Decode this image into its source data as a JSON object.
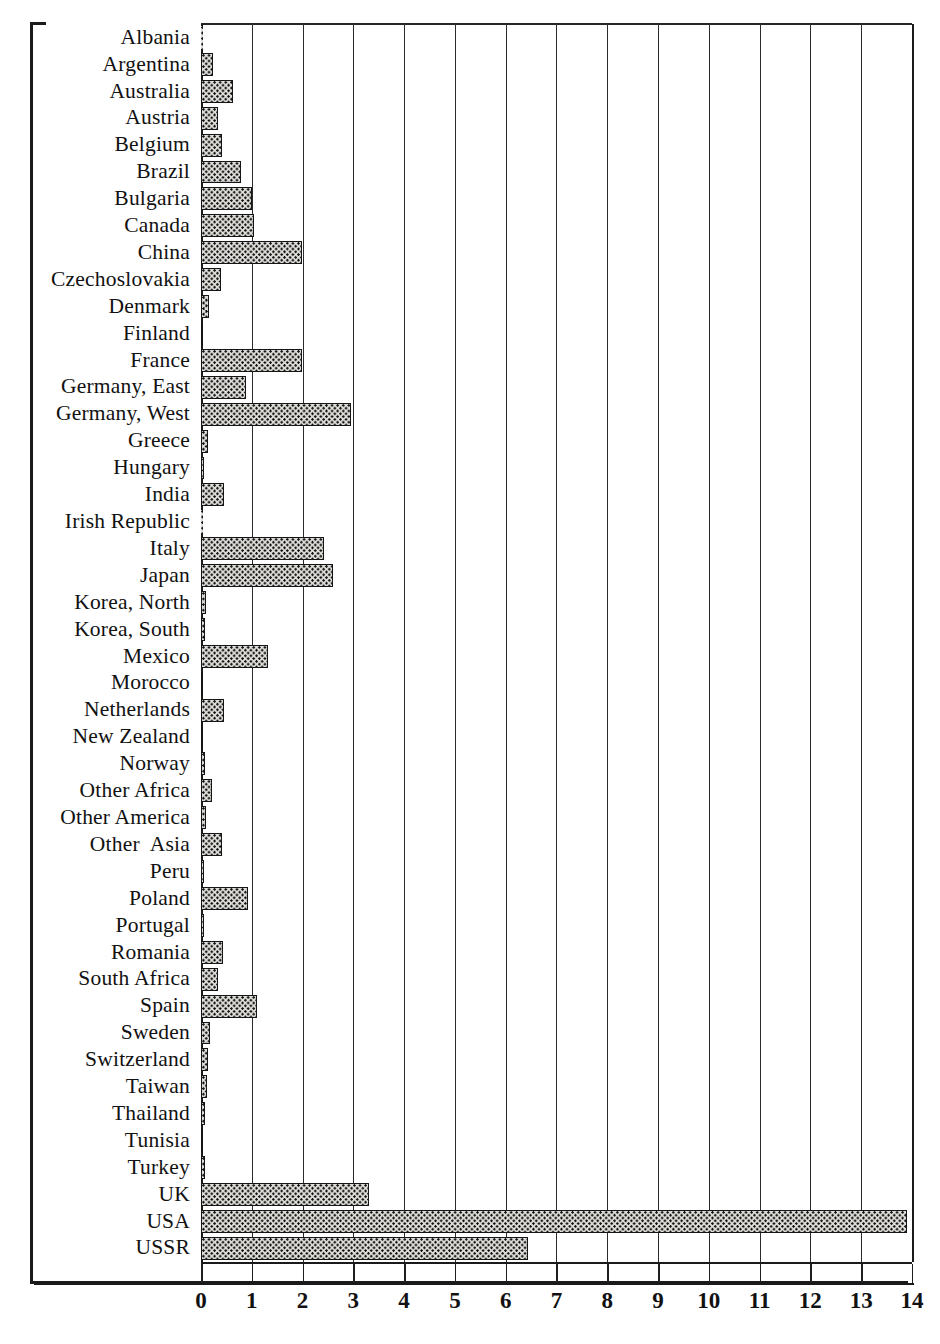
{
  "figure": {
    "top_partial_caption": "p",
    "axis_unit_px": 50.78,
    "bar_fill_color": "#dddcd8",
    "bar_edge_color": "#151515",
    "frame_color": "#1a1a1a"
  },
  "chart_data": {
    "type": "bar",
    "orientation": "horizontal",
    "title": "",
    "subtitle": "",
    "xlabel": "",
    "ylabel": "",
    "xlim": [
      0,
      14
    ],
    "ylim": null,
    "grid": true,
    "legend": null,
    "xticks": [
      "0",
      "1",
      "2",
      "3",
      "4",
      "5",
      "6",
      "7",
      "8",
      "9",
      "10",
      "11",
      "12",
      "13",
      "14"
    ],
    "xtick_values": [
      0,
      1,
      2,
      3,
      4,
      5,
      6,
      7,
      8,
      9,
      10,
      11,
      12,
      13,
      14
    ],
    "categories": [
      "Albania",
      "Argentina",
      "Australia",
      "Austria",
      "Belgium",
      "Brazil",
      "Bulgaria",
      "Canada",
      "China",
      "Czechoslovakia",
      "Denmark",
      "Finland",
      "France",
      "Germany, East",
      "Germany, West",
      "Greece",
      "Hungary",
      "India",
      "Irish Republic",
      "Italy",
      "Japan",
      "Korea, North",
      "Korea, South",
      "Mexico",
      "Morocco",
      "Netherlands",
      "New Zealand",
      "Norway",
      "Other Africa",
      "Other America",
      "Other  Asia",
      "Peru",
      "Poland",
      "Portugal",
      "Romania",
      "South Africa",
      "Spain",
      "Sweden",
      "Switzerland",
      "Taiwan",
      "Thailand",
      "Tunisia",
      "Turkey",
      "UK",
      "USA",
      "USSR"
    ],
    "values": [
      0.02,
      0.24,
      0.63,
      0.34,
      0.42,
      0.78,
      1.0,
      1.05,
      1.99,
      0.39,
      0.16,
      0.04,
      1.98,
      0.88,
      2.95,
      0.14,
      0.05,
      0.45,
      0.02,
      2.42,
      2.6,
      0.1,
      0.07,
      1.31,
      0.03,
      0.46,
      0.03,
      0.07,
      0.21,
      0.09,
      0.41,
      0.06,
      0.93,
      0.06,
      0.43,
      0.34,
      1.11,
      0.18,
      0.13,
      0.11,
      0.07,
      0.03,
      0.08,
      3.3,
      13.9,
      6.43
    ]
  }
}
